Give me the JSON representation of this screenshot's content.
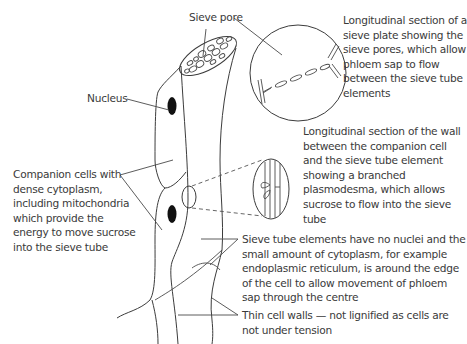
{
  "diagram": {
    "labels": {
      "sieve_pore": "Sieve pore",
      "nucleus": "Nucleus",
      "sieve_plate_section": [
        "Longitudinal section of a",
        "sieve plate showing the",
        "sieve pores, which allow",
        "phloem sap to flow",
        "between the sieve tube",
        "elements"
      ],
      "wall_section": [
        "Longitudinal section of the wall",
        "between the companion cell",
        "and the sieve tube element",
        "showing a branched",
        "plasmodesma, which allows",
        "sucrose to flow into the sieve",
        "tube"
      ],
      "companion_cells": [
        "Companion cells with",
        "dense cytoplasm,",
        "including mitochondria",
        "which provide the",
        "energy to move sucrose",
        "into the sieve tube"
      ],
      "sieve_tube_elements": [
        "Sieve tube elements have no nuclei and the",
        "small amount of cytoplasm, for example",
        "endoplasmic reticulum, is around the edge",
        "of the cell to allow movement of phloem",
        "sap through the centre"
      ],
      "thin_walls": [
        "Thin cell walls — not lignified as cells are",
        "not under tension"
      ]
    },
    "colors": {
      "line": "#3c3c3c",
      "text": "#3a3a3a",
      "nucleus_fill": "#111111",
      "background": "#ffffff"
    }
  }
}
